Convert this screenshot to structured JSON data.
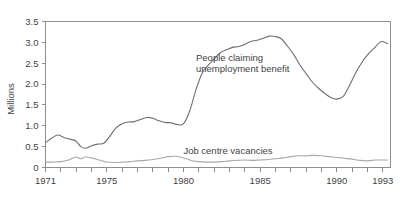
{
  "chart_data": {
    "type": "line",
    "title": "",
    "subtitle": "",
    "xlabel": "",
    "ylabel": "Millions",
    "xlim": [
      1971,
      1993.5
    ],
    "ylim": [
      0,
      3.5
    ],
    "grid": false,
    "legend_position": "inline-annotations",
    "y_ticks": [
      "0",
      "0.5",
      "1.0",
      "1.5",
      "2.0",
      "2.5",
      "3.0",
      "3.5"
    ],
    "y_tick_values": [
      0,
      0.5,
      1.0,
      1.5,
      2.0,
      2.5,
      3.0,
      3.5
    ],
    "x_ticks_labeled": [
      "1971",
      "1975",
      "1980",
      "1985",
      "1990",
      "1993"
    ],
    "x_tick_values_labeled": [
      1971,
      1975,
      1980,
      1985,
      1990,
      1993
    ],
    "x_tick_values_all": [
      1971,
      1972,
      1973,
      1974,
      1975,
      1976,
      1977,
      1978,
      1979,
      1980,
      1981,
      1982,
      1983,
      1984,
      1985,
      1986,
      1987,
      1988,
      1989,
      1990,
      1991,
      1992,
      1993
    ],
    "annotations": [
      {
        "id": "unemployment-label",
        "text_line1": "People claiming",
        "text_line2": "unemployment benefit",
        "x": 1983.0,
        "y": 2.35
      },
      {
        "id": "vacancies-label",
        "text_line1": "Job centre vacancies",
        "text_line2": "",
        "x": 1984.0,
        "y": 0.52
      }
    ],
    "series": [
      {
        "name": "People claiming unemployment benefit",
        "color": "#6e6e6e",
        "x": [
          1971.0,
          1971.4,
          1971.8,
          1972.2,
          1972.6,
          1973.0,
          1973.3,
          1973.6,
          1974.0,
          1974.4,
          1974.8,
          1975.2,
          1975.6,
          1976.0,
          1976.4,
          1976.8,
          1977.2,
          1977.6,
          1978.0,
          1978.4,
          1978.8,
          1979.2,
          1979.6,
          1980.0,
          1980.4,
          1980.8,
          1981.2,
          1981.6,
          1982.0,
          1982.4,
          1982.8,
          1983.2,
          1983.6,
          1984.0,
          1984.4,
          1984.8,
          1985.2,
          1985.6,
          1986.0,
          1986.4,
          1986.8,
          1987.2,
          1987.6,
          1988.0,
          1988.4,
          1988.8,
          1989.2,
          1989.6,
          1990.0,
          1990.4,
          1990.8,
          1991.2,
          1991.6,
          1992.0,
          1992.4,
          1992.8,
          1993.0,
          1993.3
        ],
        "y": [
          0.6,
          0.7,
          0.78,
          0.72,
          0.68,
          0.63,
          0.5,
          0.46,
          0.52,
          0.56,
          0.58,
          0.75,
          0.95,
          1.05,
          1.09,
          1.1,
          1.15,
          1.2,
          1.18,
          1.12,
          1.08,
          1.07,
          1.03,
          1.05,
          1.35,
          1.85,
          2.25,
          2.45,
          2.6,
          2.75,
          2.82,
          2.88,
          2.9,
          2.95,
          3.02,
          3.05,
          3.1,
          3.15,
          3.14,
          3.08,
          2.9,
          2.7,
          2.45,
          2.25,
          2.05,
          1.9,
          1.78,
          1.68,
          1.64,
          1.7,
          1.95,
          2.25,
          2.5,
          2.7,
          2.85,
          3.0,
          3.02,
          2.97
        ]
      },
      {
        "name": "Job centre vacancies",
        "color": "#a8a8a8",
        "x": [
          1971.0,
          1971.5,
          1972.0,
          1972.5,
          1973.0,
          1973.3,
          1973.6,
          1974.0,
          1974.5,
          1975.0,
          1975.5,
          1976.0,
          1976.5,
          1977.0,
          1977.5,
          1978.0,
          1978.5,
          1979.0,
          1979.5,
          1980.0,
          1980.5,
          1981.0,
          1981.5,
          1982.0,
          1982.5,
          1983.0,
          1983.5,
          1984.0,
          1984.5,
          1985.0,
          1985.5,
          1986.0,
          1986.5,
          1987.0,
          1987.5,
          1988.0,
          1988.5,
          1989.0,
          1989.5,
          1990.0,
          1990.5,
          1991.0,
          1991.5,
          1992.0,
          1992.5,
          1993.0,
          1993.3
        ],
        "y": [
          0.13,
          0.13,
          0.14,
          0.18,
          0.25,
          0.21,
          0.25,
          0.23,
          0.18,
          0.13,
          0.12,
          0.13,
          0.14,
          0.16,
          0.17,
          0.19,
          0.22,
          0.26,
          0.27,
          0.23,
          0.17,
          0.14,
          0.13,
          0.13,
          0.14,
          0.16,
          0.17,
          0.18,
          0.17,
          0.18,
          0.19,
          0.21,
          0.23,
          0.26,
          0.28,
          0.28,
          0.29,
          0.28,
          0.26,
          0.24,
          0.22,
          0.2,
          0.17,
          0.16,
          0.18,
          0.18,
          0.18
        ]
      }
    ]
  },
  "axis": {
    "y_title": "Millions"
  }
}
